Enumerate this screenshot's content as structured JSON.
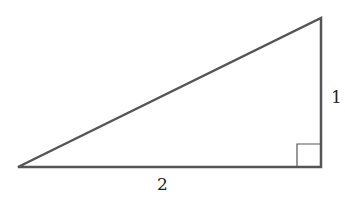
{
  "diagram": {
    "type": "right-triangle",
    "labels": {
      "vertical_leg": "1",
      "horizontal_leg": "2"
    },
    "vertices": {
      "left": [
        18,
        167
      ],
      "top_right": [
        321,
        18
      ],
      "bottom_right": [
        321,
        167
      ]
    },
    "right_angle_marker": true,
    "colors": {
      "stroke": "#555555",
      "text": "#222222"
    }
  }
}
